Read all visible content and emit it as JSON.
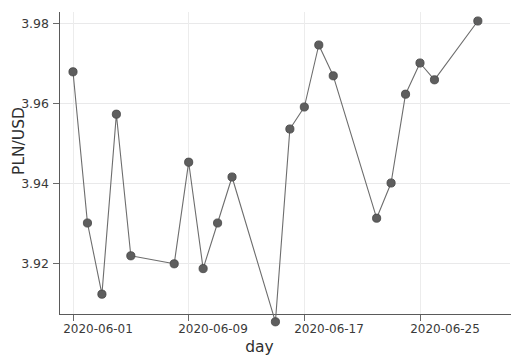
{
  "chart_data": {
    "type": "line",
    "title": "",
    "subtitle": "",
    "xlabel": "day",
    "ylabel": "PLN/USD",
    "grid": true,
    "legend": false,
    "marker": "circle",
    "line_color": "#6d6d6d",
    "marker_color": "#5e5e5e",
    "background": "#ffffff",
    "xlim": [
      "2020-05-31",
      "2020-06-30"
    ],
    "ylim": [
      3.9025,
      3.9835
    ],
    "yticks": [
      "3.92",
      "3.94",
      "3.96",
      "3.98"
    ],
    "ytick_values": [
      3.92,
      3.94,
      3.96,
      3.98
    ],
    "xticks": [
      "2020-06-01",
      "2020-06-09",
      "2020-06-17",
      "2020-06-25"
    ],
    "x": [
      "2020-06-01",
      "2020-06-02",
      "2020-06-03",
      "2020-06-04",
      "2020-06-05",
      "2020-06-08",
      "2020-06-09",
      "2020-06-10",
      "2020-06-11",
      "2020-06-12",
      "2020-06-15",
      "2020-06-16",
      "2020-06-17",
      "2020-06-18",
      "2020-06-19",
      "2020-06-22",
      "2020-06-23",
      "2020-06-24",
      "2020-06-25",
      "2020-06-26",
      "2020-06-29"
    ],
    "values": [
      3.9678,
      3.93,
      3.9122,
      3.9572,
      3.9218,
      3.9198,
      3.9452,
      3.9186,
      3.93,
      3.9415,
      3.9053,
      3.9535,
      3.959,
      3.9745,
      3.9668,
      3.9312,
      3.94,
      3.9622,
      3.97,
      3.9658,
      3.9805
    ]
  }
}
